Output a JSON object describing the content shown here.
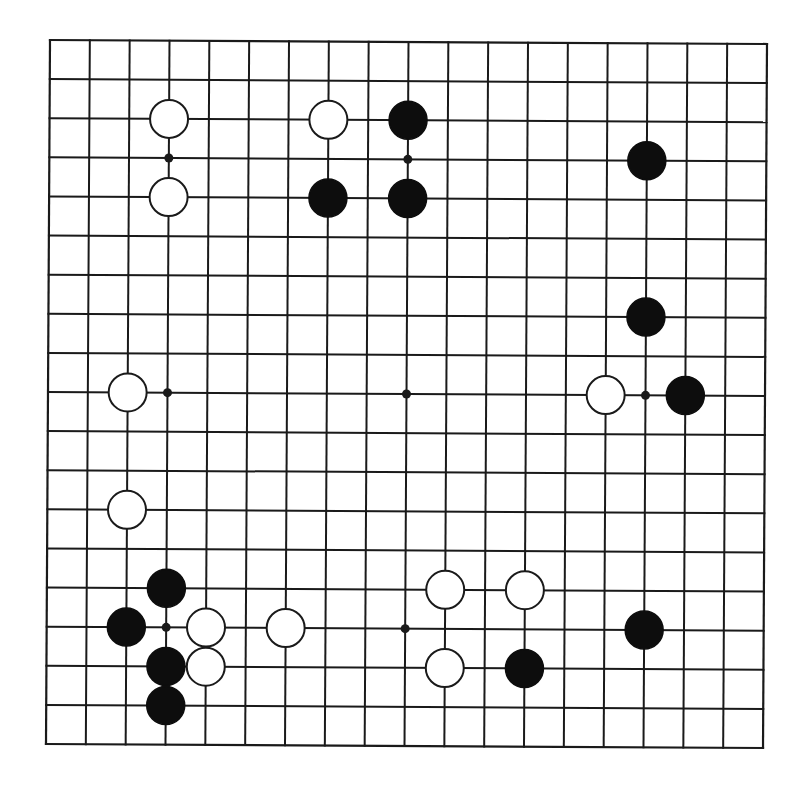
{
  "diagram": {
    "type": "go-board",
    "board_size": 19,
    "colors": {
      "line": "#1a1a1a",
      "black_stone": "#0d0d0d",
      "white_stone": "#ffffff",
      "background": "#ffffff"
    },
    "geometry": {
      "top_left": [
        50,
        40
      ],
      "top_right": [
        767,
        44
      ],
      "bottom_left": [
        46,
        744
      ],
      "stone_radius": 19,
      "hoshi_radius": 4.5
    },
    "hoshi": [
      [
        3,
        3
      ],
      [
        9,
        3
      ],
      [
        15,
        3
      ],
      [
        3,
        9
      ],
      [
        9,
        9
      ],
      [
        15,
        9
      ],
      [
        3,
        15
      ],
      [
        9,
        15
      ],
      [
        15,
        15
      ]
    ],
    "stones": {
      "black": [
        [
          9,
          2
        ],
        [
          7,
          4
        ],
        [
          9,
          4
        ],
        [
          15,
          3
        ],
        [
          15,
          7
        ],
        [
          16,
          9
        ],
        [
          3,
          14
        ],
        [
          2,
          15
        ],
        [
          3,
          16
        ],
        [
          3,
          17
        ],
        [
          15,
          15
        ],
        [
          12,
          16
        ]
      ],
      "white": [
        [
          3,
          2
        ],
        [
          3,
          4
        ],
        [
          7,
          2
        ],
        [
          2,
          9
        ],
        [
          2,
          12
        ],
        [
          14,
          9
        ],
        [
          4,
          15
        ],
        [
          4,
          16
        ],
        [
          6,
          15
        ],
        [
          10,
          14
        ],
        [
          12,
          14
        ],
        [
          10,
          16
        ]
      ]
    }
  }
}
